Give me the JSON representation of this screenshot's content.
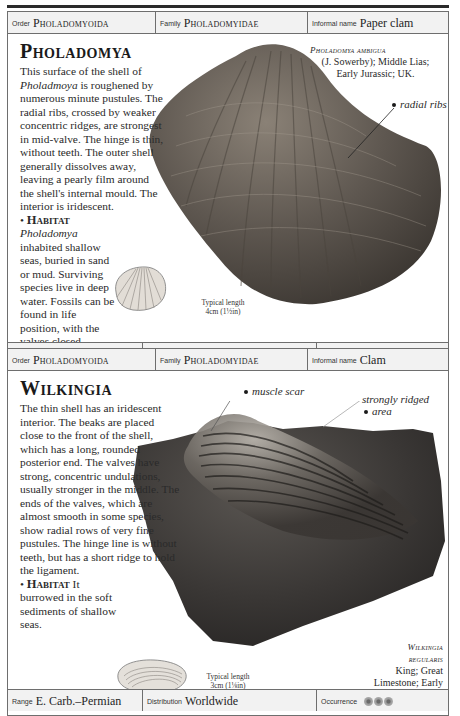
{
  "entries": [
    {
      "header": {
        "order_label": "Order",
        "order_value": "Pholadomyoida",
        "family_label": "Family",
        "family_value": "Pholadomyidae",
        "informal_label": "Informal name",
        "informal_value": "Paper clam"
      },
      "title": "Pholadomya",
      "description_parts": {
        "p1": "This surface of the shell of ",
        "p1_italic": "Pholadmoya",
        "p2": " is roughened by numerous minute pustules. The radial ribs, crossed by weaker concentric ridges, are strongest in mid-valve. The hinge is thin, without teeth. The outer shell generally dissolves away, leaving a pearly film around the shell's internal mould. The interior is iridescent.",
        "habitat_label": "Habitat",
        "habitat_italic": "Pholadomya",
        "habitat_text": " inhabited shallow seas, buried in sand or mud. Surviving species live in deep water. Fossils can be found in life position, with the valves closed."
      },
      "caption": {
        "species": "Pholadomya ambigua",
        "line2": "(J. Sowerby); Middle Lias;",
        "line3": "Early Jurassic; UK."
      },
      "callouts": [
        "radial ribs"
      ],
      "typical_length": {
        "label": "Typical length",
        "value": "4cm (1½in)"
      },
      "footer": {
        "range_label": "Range",
        "range_value": "L. Triassic–Recent",
        "distribution_label": "Distribution",
        "distribution_value": "Worldwide",
        "occurrence_label": "Occurrence",
        "occurrence_count": 5
      }
    },
    {
      "header": {
        "order_label": "Order",
        "order_value": "Pholadomyoida",
        "family_label": "Family",
        "family_value": "Pholadomyidae",
        "informal_label": "Informal name",
        "informal_value": "Clam"
      },
      "title": "Wilkingia",
      "description_parts": {
        "p1": "The thin shell has an iridescent interior. The beaks are placed close to the front of the shell, which has a long, rounded posterior end. The valves have strong, concentric undulations, usually stronger in the middle. The ends of the valves, which are almost smooth in some species, show radial rows of very fine pustules. The hinge line is without teeth, but has a short ridge to hold the ligament.",
        "habitat_label": "Habitat",
        "habitat_text": " It burrowed in the soft sediments of shallow seas."
      },
      "caption": {
        "species_line1": "Wilkingia",
        "species_line2": "regularis",
        "line3": "King; Great",
        "line4": "Limestone; Early",
        "line5": "Carboniferous; UK."
      },
      "callouts": [
        "muscle scar",
        "strongly ridged",
        "area"
      ],
      "typical_length": {
        "label": "Typical length",
        "value": "3cm (1⅛in)"
      },
      "footer": {
        "range_label": "Range",
        "range_value": "E. Carb.–Permian",
        "distribution_label": "Distribution",
        "distribution_value": "Worldwide",
        "occurrence_label": "Occurrence",
        "occurrence_count": 3
      }
    }
  ]
}
